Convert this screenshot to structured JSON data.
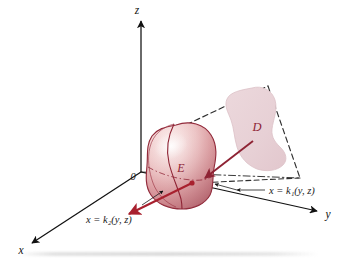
{
  "figure": {
    "origin_label": "0",
    "solid_label": "E",
    "projection_label": "D",
    "axes": {
      "z_label": "z",
      "y_label": "y",
      "x_label": "x"
    },
    "boundary_labels": {
      "front": "x = k₁(y, z)",
      "back": "x = k₂(y, z)"
    },
    "colors": {
      "solid_fill_light": "#f7e6e6",
      "solid_fill_mid": "#e8b4b4",
      "solid_fill_dark": "#c9797f",
      "solid_outline": "#8e2334",
      "projection_fill": "#e9d2d6",
      "projection_outline": "#d9bcc2",
      "arrow_red": "#a8202e",
      "axis_black": "#111111",
      "dashed_gray": "#3a3a3a",
      "background": "#ffffff"
    }
  }
}
